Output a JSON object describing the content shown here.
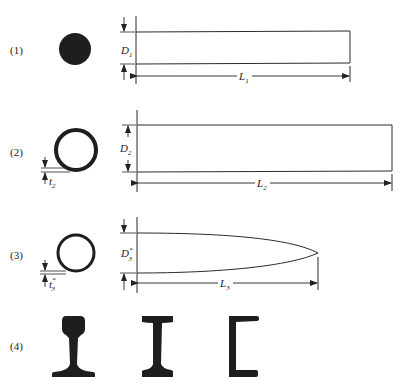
{
  "figure": {
    "colors": {
      "ink": "#1e1e1e",
      "line": "#2a2a2a",
      "background": "#ffffff"
    },
    "panels": [
      {
        "id": 1,
        "label": "(1)",
        "cross_section": "solid-circle",
        "diameter_label": {
          "main": "D",
          "sub": "1",
          "sup": ""
        },
        "length_label": {
          "main": "L",
          "sub": "1"
        },
        "profile": "rectangle"
      },
      {
        "id": 2,
        "label": "(2)",
        "cross_section": "hollow-circle",
        "thickness_label": {
          "main": "t",
          "sub": "2",
          "sup": ""
        },
        "diameter_label": {
          "main": "D",
          "sub": "2",
          "sup": ""
        },
        "length_label": {
          "main": "L",
          "sub": "2"
        },
        "profile": "rectangle"
      },
      {
        "id": 3,
        "label": "(3)",
        "cross_section": "hollow-circle",
        "thickness_label": {
          "main": "t",
          "sub": "3",
          "sup": "*"
        },
        "diameter_label": {
          "main": "D",
          "sub": "3",
          "sup": "*"
        },
        "length_label": {
          "main": "L",
          "sub": "3"
        },
        "profile": "tapered-parabolic"
      },
      {
        "id": 4,
        "label": "(4)",
        "shapes": [
          "rail-section",
          "i-beam-section",
          "channel-section"
        ]
      }
    ]
  }
}
